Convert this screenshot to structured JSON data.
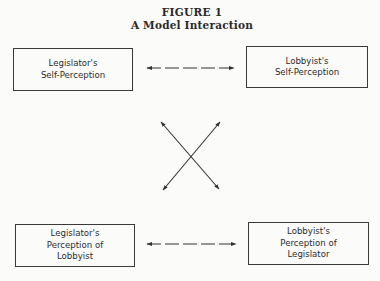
{
  "figure": {
    "number": "FIGURE 1",
    "title": "A Model Interaction"
  },
  "boxes": {
    "legislator_self": {
      "lines": [
        "Legislator's",
        "Self-Perception"
      ]
    },
    "lobbyist_self": {
      "lines": [
        "Lobbyist's",
        "Self-Perception"
      ]
    },
    "legislator_perception": {
      "lines": [
        "Legislator's",
        "Perception of",
        "Lobbyist"
      ]
    },
    "lobbyist_perception": {
      "lines": [
        "Lobbyist's",
        "Perception of",
        "Legislator"
      ]
    }
  },
  "connectors": [
    {
      "from": "Legislator's Self-Perception",
      "to": "Lobbyist's Self-Perception",
      "style": "dashed",
      "direction": "bidirectional"
    },
    {
      "from": "Legislator's Perception of Lobbyist",
      "to": "Lobbyist's Perception of Legislator",
      "style": "dashed",
      "direction": "bidirectional"
    },
    {
      "from": "Legislator's Self-Perception",
      "to": "Lobbyist's Perception of Legislator",
      "style": "solid",
      "direction": "bidirectional"
    },
    {
      "from": "Lobbyist's Self-Perception",
      "to": "Legislator's Perception of Lobbyist",
      "style": "solid",
      "direction": "bidirectional"
    }
  ],
  "colors": {
    "ink": "#333333",
    "paper": "#fbfbf9"
  }
}
